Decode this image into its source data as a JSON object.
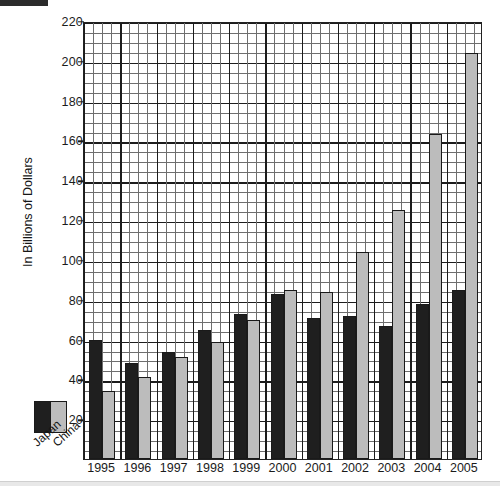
{
  "chart_data": {
    "type": "bar",
    "title": "",
    "xlabel": "",
    "ylabel": "In Billions of Dollars",
    "ylim": [
      0,
      220
    ],
    "ytick_step": 20,
    "yticks": [
      20,
      40,
      60,
      80,
      100,
      120,
      140,
      160,
      180,
      200,
      220
    ],
    "ytick_labels": [
      "20",
      "40",
      "60",
      "80",
      "100",
      "120",
      "140",
      "160",
      "180",
      "200",
      "220"
    ],
    "minor_gridlines": true,
    "minor_step": 5,
    "grid": true,
    "legend_position": "outside-bottom-left",
    "categories": [
      "1995",
      "1996",
      "1997",
      "1998",
      "1999",
      "2000",
      "2001",
      "2002",
      "2003",
      "2004",
      "2005"
    ],
    "series": [
      {
        "name": "Japan",
        "color": "#1f1f1f",
        "values": [
          60,
          48,
          54,
          65,
          73,
          83,
          71,
          72,
          67,
          78,
          85
        ]
      },
      {
        "name": "China",
        "color": "#bcbcbc",
        "values": [
          34,
          41,
          51,
          59,
          70,
          85,
          84,
          104,
          125,
          163,
          204
        ]
      }
    ]
  },
  "axes": {
    "y_title": "In Billions of Dollars"
  },
  "legend": {
    "items": [
      {
        "label": "Japan",
        "color": "#1f1f1f"
      },
      {
        "label": "China",
        "color": "#bcbcbc"
      }
    ]
  }
}
